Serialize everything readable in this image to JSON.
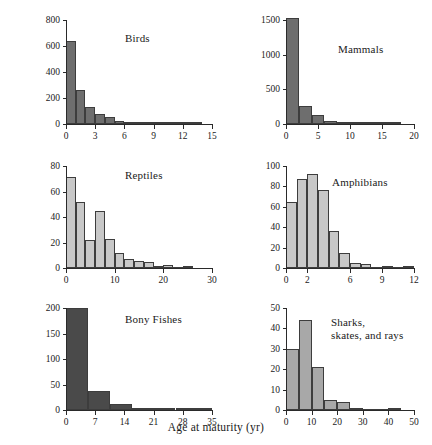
{
  "figure": {
    "xlabel": "Age at maturity (yr)",
    "ylabel": "Number of species",
    "colors": {
      "birds": "#6e6e6e",
      "mammals": "#6e6e6e",
      "reptiles": "#c8c8c8",
      "amphibians": "#c8c8c8",
      "bony_fishes": "#4a4a4a",
      "sharks": "#a8a8a8",
      "axis": "#2a2a2a",
      "background": "#ffffff"
    }
  },
  "chart_data": [
    {
      "type": "bar",
      "title": "Birds",
      "xlabel": "Age at maturity (yr)",
      "ylabel": "Number of species",
      "xlim": [
        0,
        15
      ],
      "ylim": [
        0,
        800
      ],
      "xticks": [
        0,
        3,
        6,
        9,
        12,
        15
      ],
      "yticks": [
        0,
        200,
        400,
        600,
        800
      ],
      "bin_width": 1,
      "bin_starts": [
        0,
        1,
        2,
        3,
        4,
        5,
        6,
        7,
        8,
        9,
        10,
        11,
        12,
        13
      ],
      "values": [
        640,
        265,
        130,
        78,
        55,
        22,
        10,
        7,
        5,
        4,
        18,
        3,
        2,
        2
      ],
      "grid": false,
      "legend": "none"
    },
    {
      "type": "bar",
      "title": "Mammals",
      "xlabel": "Age at maturity (yr)",
      "ylabel": "Number of species",
      "xlim": [
        0,
        20
      ],
      "ylim": [
        0,
        1500
      ],
      "xticks": [
        0,
        5,
        10,
        15,
        20
      ],
      "yticks": [
        0,
        500,
        1000,
        1500
      ],
      "bin_width": 2,
      "bin_starts": [
        0,
        2,
        4,
        6,
        8,
        10,
        12,
        14,
        16
      ],
      "values": [
        1530,
        255,
        130,
        45,
        35,
        14,
        6,
        4,
        3
      ],
      "grid": false,
      "legend": "none"
    },
    {
      "type": "bar",
      "title": "Reptiles",
      "xlabel": "Age at maturity (yr)",
      "ylabel": "Number of species",
      "xlim": [
        0,
        30
      ],
      "ylim": [
        0,
        80
      ],
      "xticks": [
        0,
        10,
        20,
        30
      ],
      "yticks": [
        0,
        20,
        40,
        60,
        80
      ],
      "bin_width": 2,
      "bin_starts": [
        0,
        2,
        4,
        6,
        8,
        10,
        12,
        14,
        16,
        18,
        20,
        22,
        24
      ],
      "values": [
        71,
        52,
        22,
        45,
        23,
        12,
        7,
        5.5,
        4.5,
        1.5,
        2.5,
        0,
        1
      ],
      "grid": false,
      "legend": "none"
    },
    {
      "type": "bar",
      "title": "Amphibians",
      "xlabel": "Age at maturity (yr)",
      "ylabel": "Number of species",
      "xlim": [
        0,
        12
      ],
      "ylim": [
        0,
        100
      ],
      "xticks": [
        0,
        2,
        6,
        9,
        12
      ],
      "yticks": [
        0,
        20,
        40,
        60,
        80,
        100
      ],
      "bin_width": 1,
      "bin_starts": [
        0,
        1,
        2,
        3,
        4,
        5,
        6,
        7,
        8,
        9,
        10,
        11
      ],
      "values": [
        65,
        87,
        92,
        76,
        36,
        15,
        5,
        4,
        0,
        2,
        0,
        1.5
      ],
      "grid": false,
      "legend": "none"
    },
    {
      "type": "bar",
      "title": "Bony Fishes",
      "xlabel": "Age at maturity (yr)",
      "ylabel": "Number of species",
      "xlim": [
        0,
        35
      ],
      "ylim": [
        0,
        200
      ],
      "xticks": [
        0,
        7,
        14,
        21,
        28,
        35
      ],
      "yticks": [
        0,
        50,
        100,
        150,
        200
      ],
      "bin_width": 5.25,
      "bin_starts": [
        0,
        5.25,
        10.5,
        15.75,
        21,
        26.25,
        31.5
      ],
      "values": [
        200,
        37,
        11,
        4,
        1,
        2,
        1
      ],
      "grid": false,
      "legend": "none"
    },
    {
      "type": "bar",
      "title": "Sharks, skates, and rays",
      "title_lines": [
        "Sharks,",
        "skates, and rays"
      ],
      "xlabel": "Age at maturity (yr)",
      "ylabel": "Number of species",
      "xlim": [
        0,
        50
      ],
      "ylim": [
        0,
        50
      ],
      "xticks": [
        0,
        10,
        20,
        30,
        40,
        50
      ],
      "yticks": [
        0,
        10,
        20,
        30,
        40,
        50
      ],
      "bin_width": 5,
      "bin_starts": [
        0,
        5,
        10,
        15,
        20,
        25,
        30,
        35,
        40
      ],
      "values": [
        30,
        44,
        21,
        5,
        4,
        1,
        0,
        0,
        1
      ],
      "grid": false,
      "legend": "none"
    }
  ],
  "panels": {
    "birds": {
      "title": "Birds"
    },
    "mammals": {
      "title": "Mammals"
    },
    "reptiles": {
      "title": "Reptiles"
    },
    "amphibians": {
      "title": "Amphibians"
    },
    "bony_fishes": {
      "title": "Bony Fishes"
    },
    "sharks": {
      "title_line1": "Sharks,",
      "title_line2": "skates, and rays"
    }
  }
}
